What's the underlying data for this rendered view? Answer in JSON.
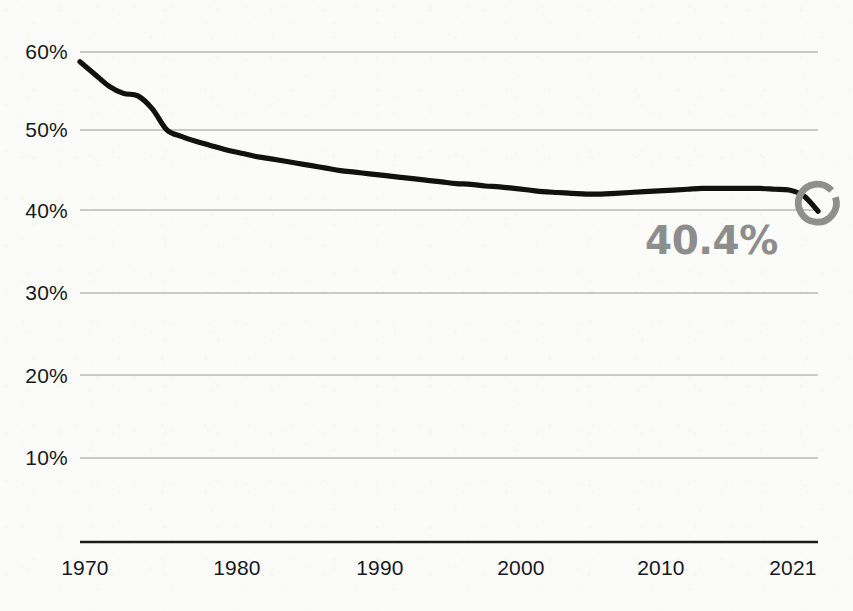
{
  "chart_data": {
    "type": "line",
    "title": "",
    "subtitle": "",
    "xlabel": "",
    "ylabel": "",
    "xlim": [
      1970,
      2021
    ],
    "ylim": [
      0,
      62
    ],
    "grid": true,
    "legend": null,
    "x_ticks": [
      "1970",
      "1980",
      "1990",
      "2000",
      "2010",
      "2021"
    ],
    "y_ticks": [
      "10%",
      "20%",
      "30%",
      "40%",
      "50%",
      "60%"
    ],
    "y_tick_values": [
      10,
      20,
      30,
      40,
      50,
      60
    ],
    "series": [
      {
        "name": "share",
        "color": "#111111",
        "x": [
          1970,
          1971,
          1972,
          1973,
          1974,
          1975,
          1976,
          1977,
          1978,
          1979,
          1980,
          1981,
          1982,
          1983,
          1984,
          1985,
          1986,
          1987,
          1988,
          1989,
          1990,
          1991,
          1992,
          1993,
          1994,
          1995,
          1996,
          1997,
          1998,
          1999,
          2000,
          2001,
          2002,
          2003,
          2004,
          2005,
          2006,
          2007,
          2008,
          2009,
          2010,
          2011,
          2012,
          2013,
          2014,
          2015,
          2016,
          2017,
          2018,
          2019,
          2020,
          2021
        ],
        "values": [
          58.8,
          57.3,
          55.8,
          54.9,
          54.6,
          53.0,
          50.4,
          49.6,
          49.0,
          48.5,
          48.0,
          47.6,
          47.2,
          46.9,
          46.6,
          46.3,
          46.0,
          45.7,
          45.4,
          45.2,
          45.0,
          44.8,
          44.6,
          44.4,
          44.2,
          44.0,
          43.8,
          43.7,
          43.5,
          43.4,
          43.2,
          43.0,
          42.8,
          42.7,
          42.6,
          42.5,
          42.5,
          42.6,
          42.7,
          42.8,
          42.9,
          43.0,
          43.1,
          43.2,
          43.2,
          43.2,
          43.2,
          43.2,
          43.1,
          43.0,
          42.3,
          40.4
        ]
      }
    ],
    "annotations": [
      {
        "name": "end-value",
        "text": "40.4%",
        "x": 2021,
        "y": 40.4,
        "color": "#8d8d8d"
      }
    ],
    "end_marker": {
      "type": "ring",
      "color": "#8f8f8f",
      "x": 2021,
      "y": 40.4
    }
  },
  "axes": {
    "y_labels": [
      "60%",
      "50%",
      "40%",
      "30%",
      "20%",
      "10%"
    ],
    "x_labels": [
      "1970",
      "1980",
      "1990",
      "2000",
      "2010",
      "2021"
    ]
  },
  "callout": {
    "value_text": "40.4%"
  },
  "colors": {
    "line": "#111111",
    "gridline": "#9a9a9a",
    "axis": "#1b1b1b",
    "accent_gray": "#8f8f8f",
    "background": "#fbfbfa",
    "text": "#18181a"
  }
}
